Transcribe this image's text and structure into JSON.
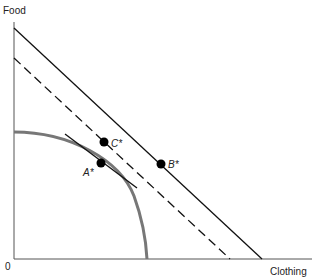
{
  "diagram": {
    "type": "production-possibility-frontier",
    "y_axis_label": "Food",
    "x_axis_label": "Clothing",
    "origin_label": "0",
    "points": [
      {
        "id": "A",
        "label": "A*",
        "description": "tangency point on PPF"
      },
      {
        "id": "C",
        "label": "C*",
        "description": "point on dashed budget line"
      },
      {
        "id": "B",
        "label": "B*",
        "description": "point on solid outer line"
      }
    ],
    "lines": [
      {
        "id": "outer-solid",
        "style": "solid"
      },
      {
        "id": "middle-dashed",
        "style": "dashed"
      },
      {
        "id": "tangent",
        "style": "solid"
      }
    ],
    "curve": {
      "id": "ppf",
      "color": "#777777"
    },
    "colors": {
      "ink": "#111111",
      "curve": "#777777"
    }
  }
}
